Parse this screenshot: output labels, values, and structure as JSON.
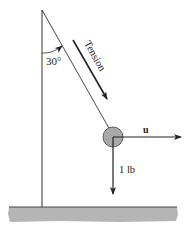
{
  "diagram": {
    "angle_label": "30°",
    "tension_label": "Tension",
    "u_label": "u",
    "weight_label": "1 lb",
    "colors": {
      "line": "#333333",
      "ball": "#a9a9a9",
      "ground": "#b5b5b5",
      "ground_edge": "#444444"
    }
  }
}
